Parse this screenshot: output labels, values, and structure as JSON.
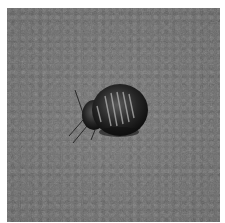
{
  "image": {
    "subject": "bed bug",
    "description": "Grayscale photo of a bed bug on a textured gray surface",
    "colors": {
      "background": "#6e6e6e",
      "bug_body": "#1a1a1a",
      "bug_highlight": "#bdbdbd",
      "border": "#ffffff"
    }
  }
}
